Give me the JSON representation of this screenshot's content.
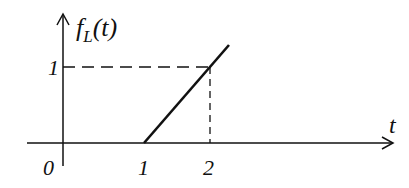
{
  "diagram": {
    "y_axis_label": "f",
    "y_axis_subscript": "L",
    "y_axis_arg": "(t)",
    "x_axis_label": "t",
    "origin_label": "0",
    "x_ticks": [
      "1",
      "2"
    ],
    "y_ticks": [
      "1"
    ],
    "line_color": "#111111",
    "curve": {
      "type": "ramp",
      "start": [
        1,
        0
      ],
      "through": [
        2,
        1
      ]
    }
  }
}
